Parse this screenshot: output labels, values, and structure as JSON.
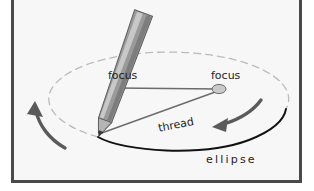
{
  "figure": {
    "kind": "geometry-construction-diagram",
    "background_color": "#f7f7f7",
    "frame_color": "#4a4a4a",
    "page_background": "#ffffff"
  },
  "labels": {
    "focus_left": "focus",
    "focus_right": "focus",
    "thread": "thread",
    "ellipse": "ellipse"
  },
  "colors": {
    "ellipse_solid": "#111111",
    "ellipse_dashed": "#b9b9b9",
    "thread_line": "#6b6b6b",
    "arrow": "#5a5a5a",
    "focus_fill": "#c9c9c9",
    "focus_stroke": "#5a5a5a",
    "pencil_body": "#8f8f8f",
    "pencil_highlight": "#c6c6c6",
    "pencil_edge": "#5e5e5e",
    "pencil_tip": "#4a4a4a",
    "label_text": "#1c1c1c"
  },
  "geometry": {
    "ellipse_center": [
      163,
      104
    ],
    "ellipse_radius_x": 120,
    "ellipse_radius_y": 47,
    "focus_left_point": [
      113,
      96
    ],
    "focus_right_point": [
      216,
      97
    ],
    "pencil_tip_point": [
      96,
      142
    ],
    "focus_marker_radius_x": 7,
    "focus_marker_radius_y": 4.5,
    "pencil_angle_deg": 20
  },
  "arrows": {
    "left": {
      "name": "rotation-arrow-left",
      "direction": "counterclockwise-up-left"
    },
    "right": {
      "name": "rotation-arrow-right",
      "direction": "leftward-along-arc"
    }
  }
}
